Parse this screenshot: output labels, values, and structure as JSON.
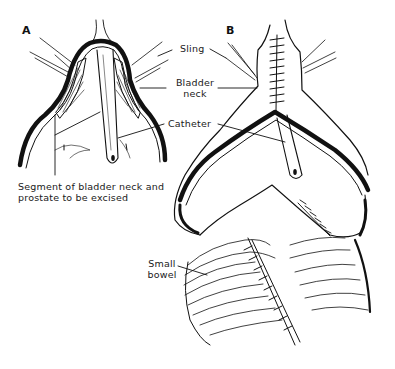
{
  "figure": {
    "panels": [
      {
        "id": "A",
        "letter": "A"
      },
      {
        "id": "B",
        "letter": "B"
      }
    ],
    "labels": {
      "sling": "Sling",
      "bladder_neck_line1": "Bladder",
      "bladder_neck_line2": "neck",
      "catheter": "Catheter",
      "segment_line1": "Segment of bladder neck and",
      "segment_line2": "prostate to be excised",
      "small_bowel_line1": "Small",
      "small_bowel_line2": "bowel"
    },
    "colors": {
      "ink": "#111111",
      "background": "#ffffff"
    }
  }
}
